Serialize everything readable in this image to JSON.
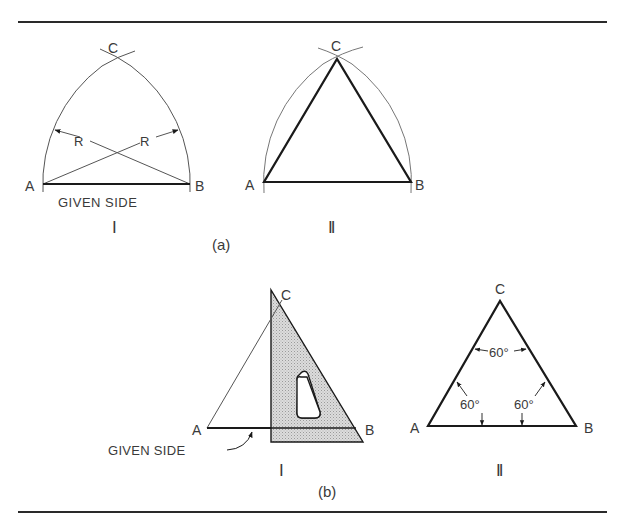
{
  "figure": {
    "panel_a": {
      "caption": "(a)",
      "step_1": {
        "roman": "I",
        "vertex_a": "A",
        "vertex_b": "B",
        "vertex_c": "C",
        "radius_label_left": "R",
        "radius_label_right": "R",
        "base_label": "GIVEN SIDE"
      },
      "step_2": {
        "roman": "II",
        "vertex_a": "A",
        "vertex_b": "B",
        "vertex_c": "C"
      }
    },
    "panel_b": {
      "caption": "(b)",
      "step_1": {
        "roman": "I",
        "vertex_a": "A",
        "vertex_b": "B",
        "vertex_c": "C",
        "base_label": "GIVEN SIDE"
      },
      "step_2": {
        "roman": "II",
        "vertex_a": "A",
        "vertex_b": "B",
        "vertex_c": "C",
        "angle_top": "60°",
        "angle_left": "60°",
        "angle_right": "60°"
      }
    },
    "colors": {
      "line": "#1a1a1a",
      "thin_line": "#555555",
      "triangle_fill": "#d4d4d4",
      "text": "#3a3a3a"
    }
  }
}
